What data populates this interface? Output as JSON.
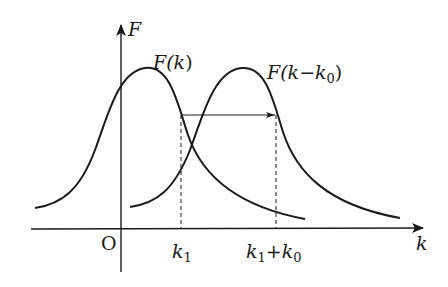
{
  "diagram": {
    "axes": {
      "y_label": "F",
      "x_label": "k",
      "origin_label": "O"
    },
    "curves": [
      {
        "name": "original",
        "label": "F(k)",
        "label_parts": [
          "F(",
          "k",
          ")"
        ]
      },
      {
        "name": "shifted",
        "label": "F(k−k0)",
        "label_parts": [
          "F(",
          "k",
          "−",
          "k",
          "0",
          ")"
        ]
      }
    ],
    "markers": {
      "k1": {
        "label": "k1",
        "base": "k",
        "sub": "1"
      },
      "k1_plus_k0": {
        "label": "k1+k0",
        "base1": "k",
        "sub1": "1",
        "plus": "+",
        "base2": "k",
        "sub2": "0"
      }
    },
    "shift_arrow": {
      "from": "k1",
      "to": "k1+k0",
      "description": "horizontal shift by k0"
    }
  }
}
